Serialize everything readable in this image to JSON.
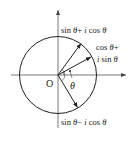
{
  "diagram": {
    "type": "unit-circle-complex-plane",
    "origin_label": "O",
    "angle_label": "θ",
    "labels": {
      "top": {
        "sin": "sin",
        "theta1": "θ",
        "plus": "+",
        "i": "i",
        "cos": "cos",
        "theta2": "θ"
      },
      "right_line1": {
        "cos": "cos",
        "theta": "θ",
        "plus": "+"
      },
      "right_line2": {
        "i": "i",
        "sin": "sin",
        "theta": "θ"
      },
      "bottom": {
        "sin": "sin",
        "theta1": "θ",
        "minus": "−",
        "i": "i",
        "cos": "cos",
        "theta2": "θ"
      }
    },
    "vectors": [
      {
        "name": "sin θ + i cos θ",
        "tip": [
          81,
          43
        ]
      },
      {
        "name": "cos θ + i sin θ",
        "tip": [
          91,
          57
        ]
      },
      {
        "name": "sin θ − i cos θ",
        "tip": [
          77,
          107
        ]
      }
    ],
    "colors": {
      "stroke": "#222222",
      "axis": "#555555"
    }
  }
}
